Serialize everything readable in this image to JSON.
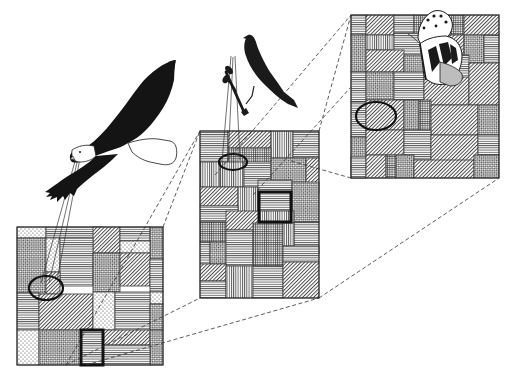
{
  "figure": {
    "title": "",
    "colors": {
      "ink": "#1a1a1a",
      "background": "#ffffff",
      "patch_line": "#3a3a3a",
      "highlight_red": "#d98a8a"
    }
  },
  "organisms": [
    {
      "id": "eagle",
      "label": "eagle",
      "scale": "coarse"
    },
    {
      "id": "songbird",
      "label": "songbird",
      "scale": "intermediate"
    },
    {
      "id": "butterfly",
      "label": "butterfly",
      "scale": "fine"
    }
  ],
  "textures": [
    "horizontal-lines",
    "vertical-lines",
    "diagonal-lines",
    "crosshatch",
    "checker",
    "dots",
    "grid"
  ],
  "panels": [
    {
      "id": "coarse",
      "x": 17,
      "y": 227,
      "w": 146,
      "h": 138,
      "patches": [
        [
          0,
          0,
          29,
          11,
          "dots"
        ],
        [
          29,
          0,
          57,
          11,
          "horizontal-lines"
        ],
        [
          76,
          0,
          27,
          26,
          "diagonal-lines"
        ],
        [
          103,
          0,
          30,
          14,
          "horizontal-lines"
        ],
        [
          133,
          0,
          13,
          32,
          "checker"
        ],
        [
          103,
          14,
          30,
          12,
          "dots"
        ],
        [
          0,
          11,
          29,
          55,
          "checker"
        ],
        [
          29,
          11,
          14,
          34,
          "dots"
        ],
        [
          43,
          11,
          33,
          48,
          "horizontal-lines"
        ],
        [
          76,
          26,
          27,
          39,
          "checker"
        ],
        [
          103,
          26,
          30,
          33,
          "diagonal-lines"
        ],
        [
          133,
          32,
          13,
          33,
          "horizontal-lines"
        ],
        [
          29,
          45,
          14,
          22,
          "diagonal-lines"
        ],
        [
          133,
          65,
          13,
          12,
          "dots"
        ],
        [
          0,
          66,
          22,
          37,
          "horizontal-lines"
        ],
        [
          22,
          67,
          54,
          36,
          "diagonal-lines"
        ],
        [
          76,
          65,
          22,
          38,
          "dots"
        ],
        [
          98,
          65,
          35,
          38,
          "horizontal-lines"
        ],
        [
          133,
          77,
          13,
          26,
          "checker"
        ],
        [
          0,
          103,
          22,
          35,
          "dots"
        ],
        [
          22,
          103,
          42,
          35,
          "checker"
        ],
        [
          64,
          103,
          22,
          35,
          "horizontal-lines"
        ],
        [
          86,
          103,
          47,
          15,
          "diagonal-lines"
        ],
        [
          133,
          103,
          13,
          35,
          "checker"
        ],
        [
          86,
          118,
          47,
          20,
          "horizontal-lines"
        ]
      ],
      "ellipse": {
        "cx": 29,
        "cy": 61,
        "rx": 17,
        "ry": 12
      },
      "focus_box": {
        "x": 64,
        "y": 103,
        "w": 22,
        "h": 35
      }
    },
    {
      "id": "intermediate",
      "x": 200,
      "y": 131,
      "w": 119,
      "h": 167,
      "patches": [
        [
          0,
          0,
          28,
          31,
          "horizontal-lines"
        ],
        [
          28,
          0,
          43,
          17,
          "diagonal-lines"
        ],
        [
          71,
          0,
          22,
          27,
          "vertical-lines"
        ],
        [
          93,
          0,
          26,
          27,
          "horizontal-lines"
        ],
        [
          28,
          17,
          43,
          20,
          "grid"
        ],
        [
          0,
          31,
          20,
          25,
          "vertical-lines"
        ],
        [
          20,
          31,
          24,
          25,
          "vertical-lines"
        ],
        [
          44,
          31,
          27,
          25,
          "horizontal-lines"
        ],
        [
          71,
          27,
          35,
          35,
          "checker"
        ],
        [
          106,
          27,
          13,
          35,
          "diagonal-lines"
        ],
        [
          0,
          56,
          38,
          19,
          "diagonal-lines"
        ],
        [
          38,
          56,
          20,
          35,
          "vertical-lines"
        ],
        [
          58,
          49,
          34,
          31,
          "horizontal-lines"
        ],
        [
          92,
          51,
          27,
          40,
          "checker"
        ],
        [
          0,
          75,
          38,
          16,
          "horizontal-lines"
        ],
        [
          0,
          91,
          26,
          20,
          "grid"
        ],
        [
          26,
          80,
          34,
          19,
          "diagonal-lines"
        ],
        [
          60,
          80,
          34,
          12,
          "vertical-lines"
        ],
        [
          94,
          91,
          25,
          32,
          "horizontal-lines"
        ],
        [
          0,
          111,
          10,
          22,
          "horizontal-lines"
        ],
        [
          10,
          111,
          16,
          22,
          "checker"
        ],
        [
          26,
          99,
          27,
          36,
          "horizontal-lines"
        ],
        [
          53,
          92,
          30,
          43,
          "grid"
        ],
        [
          83,
          92,
          11,
          23,
          "vertical-lines"
        ],
        [
          83,
          115,
          36,
          16,
          "horizontal-lines"
        ],
        [
          0,
          133,
          26,
          17,
          "diagonal-lines"
        ],
        [
          0,
          150,
          26,
          17,
          "horizontal-lines"
        ],
        [
          26,
          135,
          27,
          32,
          "vertical-lines"
        ],
        [
          53,
          135,
          30,
          32,
          "horizontal-lines"
        ],
        [
          83,
          131,
          36,
          36,
          "diagonal-lines"
        ]
      ],
      "ellipse": {
        "cx": 33,
        "cy": 31,
        "rx": 14,
        "ry": 8
      },
      "focus_box": {
        "x": 59,
        "y": 61,
        "w": 32,
        "h": 30
      }
    },
    {
      "id": "fine",
      "x": 351,
      "y": 15,
      "w": 148,
      "h": 163,
      "patches": [
        [
          0,
          0,
          15,
          20,
          "horizontal-lines"
        ],
        [
          15,
          0,
          28,
          20,
          "diagonal-lines"
        ],
        [
          43,
          0,
          20,
          18,
          "horizontal-lines"
        ],
        [
          63,
          0,
          50,
          20,
          "grid"
        ],
        [
          113,
          0,
          35,
          20,
          "diagonal-lines"
        ],
        [
          0,
          20,
          15,
          37,
          "checker"
        ],
        [
          15,
          20,
          28,
          15,
          "vertical-lines"
        ],
        [
          43,
          18,
          30,
          22,
          "horizontal-lines"
        ],
        [
          73,
          20,
          40,
          20,
          "diagonal-lines"
        ],
        [
          113,
          20,
          20,
          28,
          "checker"
        ],
        [
          133,
          20,
          15,
          28,
          "horizontal-lines"
        ],
        [
          15,
          35,
          38,
          22,
          "diagonal-lines"
        ],
        [
          53,
          40,
          35,
          22,
          "checker"
        ],
        [
          88,
          40,
          30,
          28,
          "horizontal-lines"
        ],
        [
          0,
          57,
          15,
          30,
          "horizontal-lines"
        ],
        [
          15,
          57,
          28,
          28,
          "checker"
        ],
        [
          43,
          57,
          30,
          28,
          "horizontal-lines"
        ],
        [
          73,
          62,
          45,
          28,
          "diagonal-lines"
        ],
        [
          118,
          48,
          30,
          42,
          "diagonal-lines"
        ],
        [
          0,
          87,
          15,
          35,
          "horizontal-lines"
        ],
        [
          15,
          85,
          38,
          30,
          "diagonal-lines"
        ],
        [
          53,
          85,
          15,
          30,
          "checker"
        ],
        [
          68,
          85,
          12,
          30,
          "grid"
        ],
        [
          80,
          90,
          47,
          30,
          "diagonal-lines"
        ],
        [
          127,
          90,
          21,
          30,
          "checker"
        ],
        [
          0,
          122,
          15,
          41,
          "checker"
        ],
        [
          15,
          115,
          38,
          25,
          "diagonal-lines"
        ],
        [
          53,
          115,
          27,
          30,
          "horizontal-lines"
        ],
        [
          80,
          120,
          47,
          30,
          "diagonal-lines"
        ],
        [
          127,
          120,
          21,
          20,
          "horizontal-lines"
        ],
        [
          0,
          142,
          15,
          21,
          "horizontal-lines"
        ],
        [
          15,
          140,
          20,
          23,
          "diagonal-lines"
        ],
        [
          35,
          140,
          10,
          23,
          "grid"
        ],
        [
          45,
          140,
          18,
          23,
          "checker"
        ],
        [
          63,
          145,
          60,
          18,
          "diagonal-lines"
        ],
        [
          123,
          140,
          25,
          23,
          "checker"
        ]
      ],
      "ellipse": {
        "cx": 25,
        "cy": 101,
        "rx": 20,
        "ry": 14
      }
    }
  ],
  "connectors": {
    "dashed": [
      [
        66,
        365,
        200,
        131
      ],
      [
        163,
        227,
        200,
        131
      ],
      [
        66,
        365,
        200,
        298
      ],
      [
        86,
        365,
        319,
        298
      ],
      [
        215,
        175,
        351,
        15
      ],
      [
        319,
        131,
        351,
        15
      ],
      [
        291,
        161,
        351,
        178
      ],
      [
        319,
        298,
        499,
        178
      ],
      [
        253,
        195,
        351,
        87
      ]
    ],
    "sight_lines": [
      [
        77,
        154,
        41,
        283
      ],
      [
        79,
        154,
        49,
        283
      ],
      [
        81,
        153,
        57,
        280
      ],
      [
        231,
        56,
        222,
        162
      ],
      [
        233,
        57,
        228,
        162
      ],
      [
        235,
        56,
        240,
        160
      ]
    ]
  }
}
